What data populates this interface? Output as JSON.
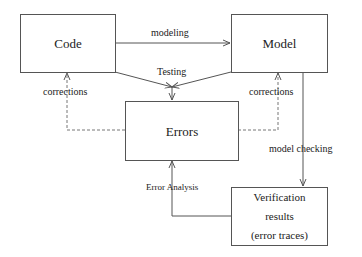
{
  "nodes": {
    "code": {
      "label": "Code"
    },
    "model": {
      "label": "Model"
    },
    "errors": {
      "label": "Errors"
    },
    "verification": {
      "lines": [
        "Verification",
        "results",
        "(error traces)"
      ]
    }
  },
  "edges": {
    "modeling": {
      "label": "modeling",
      "from": "Code",
      "to": "Model",
      "style": "solid"
    },
    "testing": {
      "label": "Testing",
      "from": [
        "Code",
        "Model"
      ],
      "to": "Errors",
      "style": "solid"
    },
    "corrections_left": {
      "label": "corrections",
      "from": "Errors",
      "to": "Code",
      "style": "dashed"
    },
    "corrections_right": {
      "label": "corrections",
      "from": "Errors",
      "to": "Model",
      "style": "dashed"
    },
    "model_checking": {
      "label": "model checking",
      "from": "Model",
      "to": "Verification results",
      "style": "solid"
    },
    "error_analysis": {
      "label": "Error Analysis",
      "from": "Verification results",
      "to": "Errors",
      "style": "solid"
    }
  },
  "colors": {
    "line": "#555555",
    "text": "#222222",
    "background": "#ffffff"
  }
}
